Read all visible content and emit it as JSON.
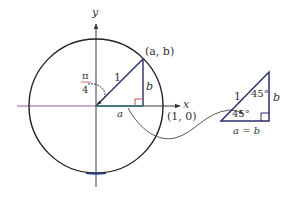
{
  "diagram": {
    "colors": {
      "ink": "#2b2b3a",
      "triangle": "#2a2d6e",
      "x_axis_left": "#9a5aa0",
      "right_angle": "#c0504d",
      "curve": "#444444"
    },
    "unit_circle": {
      "axis_x_label": "x",
      "axis_y_label": "y",
      "point_label": "(a, b)",
      "unit_point_label": "(1, 0)",
      "hypotenuse_label": "1",
      "vertical_leg_label": "b",
      "horizontal_leg_label": "a",
      "angle_numerator": "π",
      "angle_denominator": "4"
    },
    "small_triangle": {
      "hypotenuse_label": "1",
      "top_angle_label": "45°",
      "bottom_angle_label": "45°",
      "vertical_leg_label": "b",
      "bottom_label": "a = b"
    }
  }
}
